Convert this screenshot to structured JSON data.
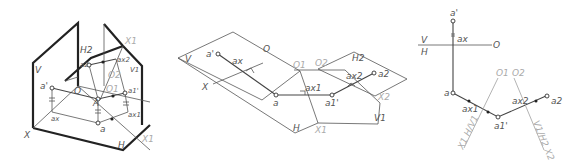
{
  "figures": [
    {
      "id": "isometric-view",
      "labels": {
        "V": "V",
        "H": "H",
        "X": "X",
        "X1": "X1",
        "H2": "H2",
        "V1": "V1",
        "a_prime": "a'",
        "a": "a",
        "A": "A",
        "ax": "ax",
        "ax1": "ax1",
        "ax2": "ax2",
        "a1_prime": "a1'",
        "a2": "a2",
        "O": "O",
        "O1": "O1",
        "O2": "O2",
        "X1_top": "X1"
      }
    },
    {
      "id": "unfolded-planes",
      "labels": {
        "V": "V",
        "X": "X",
        "O": "O",
        "O1": "O1",
        "O2": "O2",
        "H2": "H2",
        "H": "H",
        "V1": "V1",
        "X1": "X1",
        "X2": "X2",
        "a_prime": "a'",
        "ax": "ax",
        "a": "a",
        "ax1": "ax1",
        "a1_prime": "a1'",
        "ax2": "ax2",
        "a2": "a2"
      }
    },
    {
      "id": "epure",
      "labels": {
        "a_prime": "a'",
        "ax": "ax",
        "V": "V",
        "H": "H",
        "O": "O",
        "a": "a",
        "ax1": "ax1",
        "a1_prime": "a1'",
        "ax2": "ax2",
        "a2": "a2",
        "O1": "O1",
        "O2": "O2",
        "axis1": "X1 H/V1",
        "axis2": "V1/H2 X2"
      }
    }
  ]
}
